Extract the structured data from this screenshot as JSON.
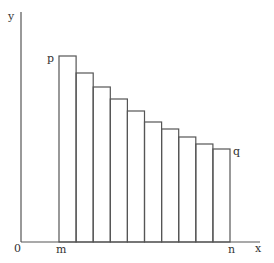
{
  "diagram": {
    "type": "step-rectangles-under-curve",
    "axis_labels": {
      "y": "y",
      "x": "x",
      "origin": "0"
    },
    "point_labels": {
      "p": "p",
      "q": "q",
      "m": "m",
      "n": "n"
    },
    "bars": {
      "count": 10,
      "x_start": 59,
      "x_end": 230,
      "baseline": 242,
      "tops": [
        56,
        73,
        87,
        99,
        111,
        122,
        129,
        137,
        144,
        149
      ]
    },
    "colors": {
      "stroke": "#555555",
      "text": "#333333",
      "background": "#ffffff"
    }
  }
}
